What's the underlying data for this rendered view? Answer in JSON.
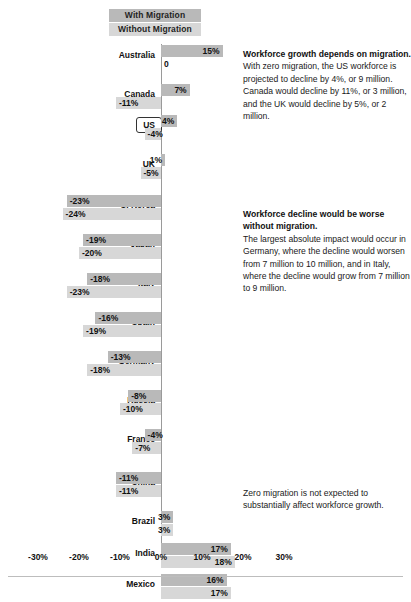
{
  "legend": {
    "with_label": "With Migration",
    "without_label": "Without Migration",
    "with_color": "#b9b9b9",
    "without_color": "#d7d7d7"
  },
  "axis": {
    "ticks": [
      "-30%",
      "-20%",
      "-10%",
      "0%",
      "10%",
      "20%",
      "30%"
    ],
    "tick_values": [
      -30,
      -20,
      -10,
      0,
      10,
      20,
      30
    ],
    "min": -30,
    "max": 30
  },
  "highlight": {
    "country": "US"
  },
  "notes": [
    {
      "head": "Workforce growth depends on migration.",
      "body": "With zero migration, the US workforce is projected to decline by 4%, or 9 million. Canada would decline by 11%, or 3 million, and the UK would decline by 5%, or 2 million."
    },
    {
      "head": "Workforce decline would be worse without migration.",
      "body": "The largest absolute impact would occur in Germany, where the decline would worsen from 7 million to 10 million, and in Italy, where the decline would grow from 7 million to 9 million."
    },
    {
      "head": "",
      "body": "Zero migration is not expected to substantially affect workforce growth."
    }
  ],
  "chart_data": {
    "type": "bar",
    "title": "",
    "xlabel": "",
    "ylabel": "",
    "orientation": "horizontal",
    "xlim": [
      -30,
      30
    ],
    "grid": false,
    "legend_position": "top",
    "categories": [
      "Australia",
      "Canada",
      "US",
      "UK",
      "S. Korea",
      "Japan",
      "Italy",
      "Spain",
      "Germany",
      "Russia",
      "France",
      "China",
      "Brazil",
      "India",
      "Mexico"
    ],
    "series": [
      {
        "name": "With Migration",
        "color": "#b9b9b9",
        "values": [
          15,
          7,
          4,
          1,
          -23,
          -19,
          -18,
          -16,
          -13,
          -8,
          -4,
          -11,
          3,
          17,
          16
        ],
        "labels": [
          "15%",
          "7%",
          "4%",
          "1%",
          "-23%",
          "-19%",
          "-18%",
          "-16%",
          "-13%",
          "-8%",
          "-4%",
          "-11%",
          "3%",
          "17%",
          "16%"
        ]
      },
      {
        "name": "Without Migration",
        "color": "#d7d7d7",
        "values": [
          0,
          -11,
          -4,
          -5,
          -24,
          -20,
          -23,
          -19,
          -18,
          -10,
          -7,
          -11,
          3,
          18,
          17
        ],
        "labels": [
          "0",
          "-11%",
          "-4%",
          "-5%",
          "-24%",
          "-20%",
          "-23%",
          "-19%",
          "-18%",
          "-10%",
          "-7%",
          "-11%",
          "3%",
          "18%",
          "17%"
        ]
      }
    ]
  }
}
